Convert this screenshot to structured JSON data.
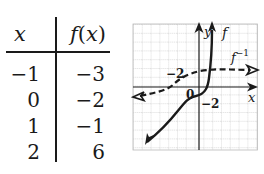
{
  "table": {
    "headers": {
      "x": "x",
      "fx": "f(x)"
    },
    "rows": [
      {
        "x": "−1",
        "fx": "−3"
      },
      {
        "x": "0",
        "fx": "−2"
      },
      {
        "x": "1",
        "fx": "−1"
      },
      {
        "x": "2",
        "fx": "6"
      }
    ]
  },
  "graph": {
    "x_axis_label": "x",
    "y_axis_label": "y",
    "curve_f_label": "f",
    "curve_finv_label": "f−1",
    "origin_label": "0",
    "f_intercept_label": "−2",
    "finv_intercept_label": "−2",
    "colors": {
      "ink": "#1a1a1a",
      "grid": "#b8b8b8"
    }
  }
}
